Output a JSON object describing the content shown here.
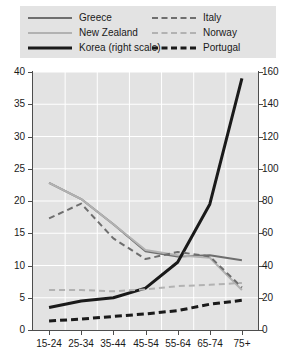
{
  "legend": {
    "entries": [
      {
        "label": "Greece",
        "style": "solid",
        "color": "#6e6e6e",
        "column": "left"
      },
      {
        "label": "New Zealand",
        "style": "solid",
        "color": "#b2b2b2",
        "column": "left"
      },
      {
        "label": "Korea (right scale)",
        "style": "solid",
        "color": "#1a1a1a",
        "column": "left"
      },
      {
        "label": "Italy",
        "style": "dashed",
        "color": "#6e6e6e",
        "column": "right"
      },
      {
        "label": "Norway",
        "style": "dashed",
        "color": "#b2b2b2",
        "column": "right"
      },
      {
        "label": "Portugal",
        "style": "dashed",
        "color": "#1a1a1a",
        "column": "right"
      }
    ]
  },
  "axes": {
    "left_ticks": [
      "0",
      "5",
      "10",
      "15",
      "20",
      "25",
      "30",
      "35",
      "40"
    ],
    "right_ticks": [
      "0",
      "20",
      "40",
      "60",
      "80",
      "100",
      "120",
      "140",
      "160"
    ],
    "x_ticks": [
      "15-24",
      "25-34",
      "35-44",
      "45-54",
      "55-64",
      "65-74",
      "75+"
    ]
  },
  "chart_data": {
    "type": "line",
    "title": "",
    "subtitle": "",
    "xlabel": "",
    "ylabel": "",
    "categories": [
      "15-24",
      "25-34",
      "35-44",
      "45-54",
      "55-64",
      "65-74",
      "75+"
    ],
    "ylim": [
      0,
      40
    ],
    "y2lim": [
      0,
      160
    ],
    "ylabel_right": "",
    "grid": true,
    "grid_color": "#ffffff",
    "plot_background": "#e3e3e3",
    "legend_position": "top",
    "series": [
      {
        "name": "Greece",
        "axis": "left",
        "style": "solid",
        "color": "#6e6e6e",
        "width": 2,
        "values": [
          22.8,
          20.3,
          16.4,
          12.2,
          11.4,
          11.6,
          10.8
        ]
      },
      {
        "name": "New Zealand",
        "axis": "left",
        "style": "solid",
        "color": "#b2b2b2",
        "width": 2,
        "values": [
          22.8,
          20.3,
          16.4,
          12.4,
          11.6,
          11.2,
          6.2
        ]
      },
      {
        "name": "Korea (right scale)",
        "axis": "right",
        "style": "solid",
        "color": "#1a1a1a",
        "width": 3,
        "values": [
          14,
          18,
          20,
          26,
          42,
          78,
          156
        ]
      },
      {
        "name": "Italy",
        "axis": "left",
        "style": "dashed",
        "color": "#6e6e6e",
        "width": 2,
        "values": [
          17.3,
          19.6,
          14.2,
          11.0,
          12.1,
          11.4,
          6.6
        ]
      },
      {
        "name": "Norway",
        "axis": "left",
        "style": "dashed",
        "color": "#b2b2b2",
        "width": 2,
        "values": [
          6.2,
          6.2,
          6.0,
          6.3,
          6.8,
          7.0,
          7.3
        ]
      },
      {
        "name": "Portugal",
        "axis": "left",
        "style": "dashed",
        "color": "#1a1a1a",
        "width": 3,
        "values": [
          1.4,
          1.7,
          2.1,
          2.5,
          3.0,
          4.0,
          4.6
        ]
      }
    ]
  }
}
